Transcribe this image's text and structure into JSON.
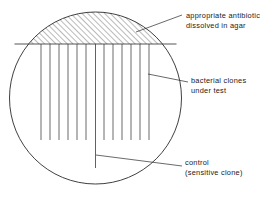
{
  "figure": {
    "background_color": "#ffffff",
    "stroke_color": "#2a2a2a",
    "hatch_color": "#3a3a3a"
  },
  "plate": {
    "shape": "circle",
    "center_x": 95.5,
    "center_y": 98,
    "radius": 86
  },
  "antibiotic_zone": {
    "name": "hatched-segment",
    "chord_y": 44,
    "hatch_angle_deg": 45,
    "hatch_spacing_px": 4
  },
  "streaks": {
    "count": 12,
    "top_y": 44,
    "bottom_y": 140,
    "x_positions": [
      41,
      50,
      59,
      68,
      77,
      86,
      104,
      113,
      122,
      131,
      140,
      149
    ]
  },
  "control_streak": {
    "x": 95.5,
    "top_y": 44,
    "bottom_y": 168
  },
  "labels": {
    "antibiotic": {
      "line1": "appropriate antibiotic",
      "line2": "dissolved in agar"
    },
    "clones": {
      "line1": "bacterial clones",
      "line2": "under test"
    },
    "control": {
      "line1": "control",
      "line2": "(sensitive clone)"
    }
  },
  "leaders": [
    {
      "name": "leader-antibiotic",
      "from_x": 136,
      "from_y": 32,
      "to_x": 182,
      "to_y": 15
    },
    {
      "name": "leader-clones",
      "from_x": 148,
      "from_y": 74,
      "to_x": 188,
      "to_y": 82
    },
    {
      "name": "leader-control",
      "from_x": 96,
      "from_y": 155,
      "to_x": 182,
      "to_y": 166
    }
  ]
}
